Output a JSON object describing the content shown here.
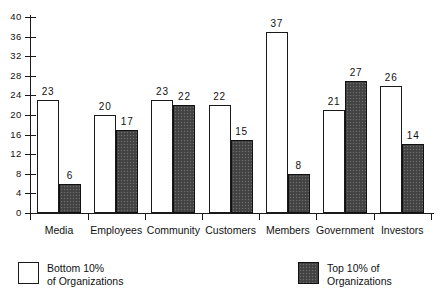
{
  "chart_data": {
    "type": "bar",
    "title": "",
    "subtitle": "",
    "xlabel": "",
    "ylabel": "",
    "categories": [
      "Media",
      "Employees",
      "Community",
      "Customers",
      "Members",
      "Government",
      "Investors"
    ],
    "series": [
      {
        "name": "Bottom 10% of Organizations",
        "style": "white",
        "values": [
          23,
          20,
          23,
          22,
          37,
          21,
          26
        ]
      },
      {
        "name": "Top 10% of Organizations",
        "style": "dark-stipple",
        "values": [
          6,
          17,
          22,
          15,
          8,
          27,
          14
        ]
      }
    ],
    "ylim": [
      0,
      40
    ],
    "yticks": [
      0,
      4,
      8,
      12,
      16,
      20,
      24,
      28,
      32,
      36,
      40
    ],
    "grid": false,
    "legend_position": "bottom",
    "data_labels": true
  },
  "legend": {
    "items": [
      {
        "swatch": "white-square",
        "line1": "Bottom  10%",
        "line2": "of Organizations"
      },
      {
        "swatch": "dark-stipple-square",
        "line1": "Top 10% of",
        "line2": "Organizations"
      }
    ]
  },
  "colors": {
    "series_bottom": "#ffffff",
    "series_top": "#474747",
    "axis": "#1a1a1a",
    "text": "#111111",
    "background": "#ffffff"
  }
}
